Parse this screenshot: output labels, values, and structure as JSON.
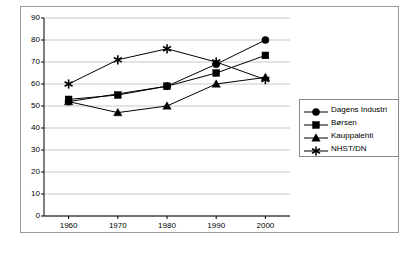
{
  "chart_data": {
    "type": "line",
    "title": "",
    "xlabel": "",
    "ylabel": "",
    "categories": [
      "1960",
      "1970",
      "1980",
      "1990",
      "2000"
    ],
    "x": [
      1960,
      1970,
      1980,
      1990,
      2000
    ],
    "xlim": [
      1955,
      2005
    ],
    "ylim": [
      0,
      90
    ],
    "yticks": [
      0,
      10,
      20,
      30,
      40,
      50,
      60,
      70,
      80,
      90
    ],
    "grid": "horizontal",
    "legend_position": "right",
    "series": [
      {
        "name": "Dagens Industri",
        "marker": "circle",
        "color": "#000000",
        "values": [
          52,
          null,
          59,
          69,
          80
        ]
      },
      {
        "name": "Børsen",
        "marker": "square",
        "color": "#000000",
        "values": [
          53,
          55,
          59,
          65,
          73
        ]
      },
      {
        "name": "Kauppalehti",
        "marker": "triangle",
        "color": "#000000",
        "values": [
          52,
          47,
          50,
          60,
          63
        ]
      },
      {
        "name": "NHST/DN",
        "marker": "star",
        "color": "#000000",
        "values": [
          60,
          71,
          76,
          70,
          62
        ]
      }
    ]
  },
  "axis": {
    "y_tick_labels": [
      "90",
      "80",
      "70",
      "60",
      "50",
      "40",
      "30",
      "20",
      "10",
      "0"
    ],
    "x_tick_labels": [
      "1960",
      "1970",
      "1980",
      "1990",
      "2000"
    ]
  },
  "legend": {
    "items": [
      {
        "label": "Dagens Industri",
        "marker": "circle"
      },
      {
        "label": "Børsen",
        "marker": "square"
      },
      {
        "label": "Kauppalehti",
        "marker": "triangle"
      },
      {
        "label": "NHST/DN",
        "marker": "star"
      }
    ]
  },
  "colors": {
    "axis": "#000000",
    "grid": "#c8c8c8",
    "frame": "#9a9a9a",
    "series": "#000000",
    "background": "#ffffff"
  }
}
